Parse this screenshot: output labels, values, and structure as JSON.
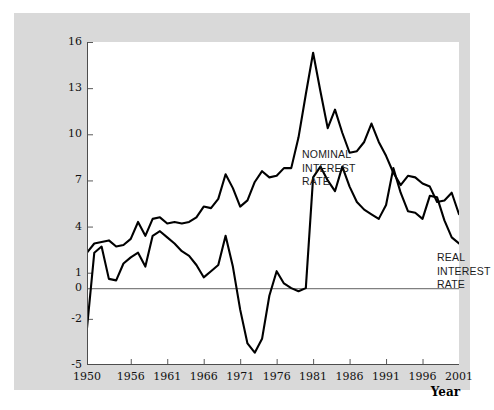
{
  "figure": {
    "background_color": "#d9d9d9",
    "plot_background_color": "#ffffff",
    "line_color": "#000000",
    "zero_line_color": "#808080"
  },
  "chart_data": {
    "type": "line",
    "title": "",
    "xlabel": "Year",
    "ylabel": "Interest rate (percent per year)",
    "xlim": [
      1950,
      2001
    ],
    "ylim": [
      -5,
      16
    ],
    "grid": false,
    "legend_position": "inline-annotations",
    "yticks": [
      16,
      13,
      10,
      7,
      4,
      1,
      0,
      -2,
      -5
    ],
    "ytick_labels": [
      "16",
      "13",
      "10",
      "7",
      "4",
      "1",
      "0",
      "-2",
      "-5"
    ],
    "xticks": [
      1950,
      1956,
      1961,
      1966,
      1971,
      1976,
      1981,
      1986,
      1991,
      1996,
      2001
    ],
    "xtick_labels": [
      "1950",
      "1956",
      "1961",
      "1966",
      "1971",
      "1976",
      "1981",
      "1986",
      "1991",
      "1996",
      "2001"
    ],
    "x": [
      1950,
      1951,
      1952,
      1953,
      1954,
      1955,
      1956,
      1957,
      1958,
      1959,
      1960,
      1961,
      1962,
      1963,
      1964,
      1965,
      1966,
      1967,
      1968,
      1969,
      1970,
      1971,
      1972,
      1973,
      1974,
      1975,
      1976,
      1977,
      1978,
      1979,
      1980,
      1981,
      1982,
      1983,
      1984,
      1985,
      1986,
      1987,
      1988,
      1989,
      1990,
      1991,
      1992,
      1993,
      1994,
      1995,
      1996,
      1997,
      1998,
      1999,
      2000,
      2001
    ],
    "series": [
      {
        "name": "NOMINAL INTEREST RATE",
        "annotation": "NOMINAL\nINTEREST\nRATE",
        "values": [
          2.3,
          2.9,
          3.0,
          3.1,
          2.7,
          2.8,
          3.2,
          4.3,
          3.4,
          4.5,
          4.6,
          4.2,
          4.3,
          4.2,
          4.3,
          4.6,
          5.3,
          5.2,
          5.8,
          7.4,
          6.5,
          5.3,
          5.7,
          6.9,
          7.6,
          7.2,
          7.3,
          7.8,
          7.8,
          9.8,
          12.6,
          15.3,
          12.8,
          10.4,
          11.6,
          10.1,
          8.8,
          8.9,
          9.5,
          10.7,
          9.5,
          8.6,
          7.5,
          6.7,
          7.3,
          7.2,
          6.8,
          6.6,
          5.6,
          5.7,
          6.2,
          4.8
        ]
      },
      {
        "name": "REAL INTEREST RATE",
        "annotation": "REAL\nINTEREST\nRATE",
        "values": [
          -2.6,
          2.3,
          2.7,
          0.6,
          0.5,
          1.6,
          2.0,
          2.3,
          1.4,
          3.4,
          3.7,
          3.3,
          2.9,
          2.4,
          2.1,
          1.5,
          0.7,
          1.1,
          1.5,
          3.4,
          1.4,
          -1.4,
          -3.6,
          -4.2,
          -3.3,
          -0.5,
          1.1,
          0.3,
          0.0,
          -0.2,
          0.0,
          7.2,
          7.9,
          7.0,
          6.3,
          7.9,
          6.6,
          5.6,
          5.1,
          4.8,
          4.5,
          5.4,
          7.8,
          6.2,
          5.0,
          4.9,
          4.5,
          6.0,
          5.9,
          4.4,
          3.3,
          2.9
        ]
      }
    ]
  },
  "annotations": {
    "nominal": "NOMINAL\nINTEREST\nRATE",
    "real": "REAL\nINTEREST\nRATE"
  },
  "axis_titles": {
    "y": "Interest rate (percent per year)",
    "x": "Year"
  }
}
